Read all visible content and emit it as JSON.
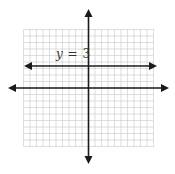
{
  "diagram": {
    "type": "coordinate-plane",
    "grid": {
      "x_min": -10,
      "x_max": 10,
      "y_min": -9,
      "y_max": 9,
      "color": "#c8c8c8"
    },
    "axes": {
      "color": "#1a1a1a",
      "arrows": true
    },
    "line": {
      "equation": "y = 3",
      "label_var": "y",
      "label_eq": "=",
      "label_val": "3",
      "y_value": 3,
      "color": "#1a1a1a"
    }
  }
}
